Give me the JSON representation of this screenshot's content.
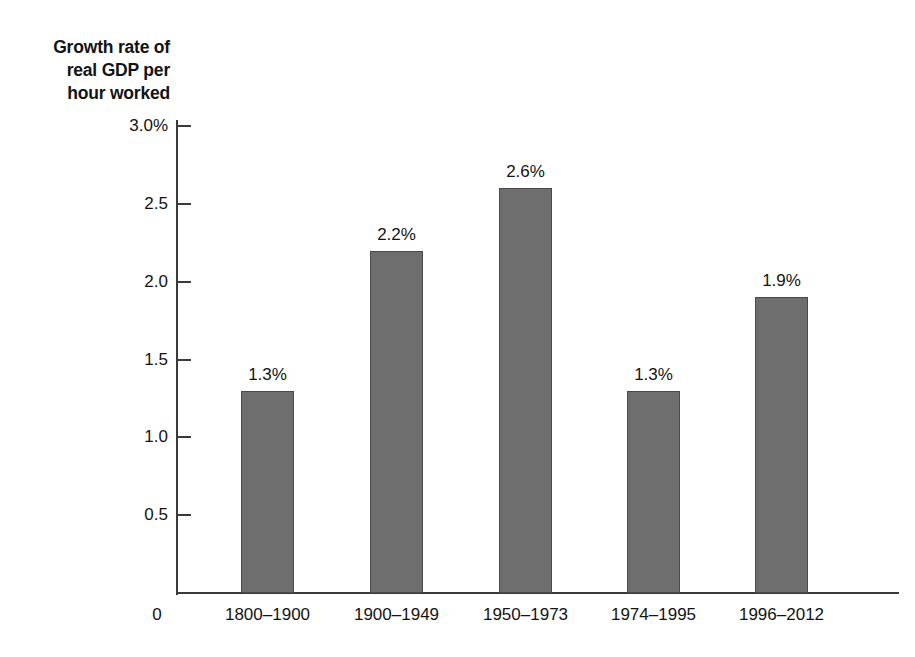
{
  "chart_data": {
    "type": "bar",
    "title": "",
    "subtitle": "",
    "xlabel": "",
    "ylabel": "Growth rate of real GDP per hour worked",
    "ylabel_lines": [
      "Growth rate of",
      "real GDP per",
      "hour worked"
    ],
    "categories": [
      "1800–1900",
      "1900–1949",
      "1950–1973",
      "1974–1995",
      "1996–2012"
    ],
    "values": [
      1.3,
      2.2,
      2.6,
      1.3,
      1.9
    ],
    "value_labels": [
      "1.3%",
      "2.2%",
      "2.6%",
      "1.3%",
      "1.9%"
    ],
    "ylim": [
      0,
      3.0
    ],
    "ytick_values": [
      0.5,
      1.0,
      1.5,
      2.0,
      2.5,
      3.0
    ],
    "ytick_labels": [
      "0.5",
      "1.0",
      "1.5",
      "2.0",
      "2.5",
      "3.0%"
    ],
    "origin_label": "0",
    "grid": false,
    "legend": false,
    "bar_color": "#6e6e6e",
    "bar_edge_color": "#4a4a4a",
    "axis_color": "#3a3a3a",
    "text_color": "#131313",
    "background_color": "#ffffff"
  }
}
